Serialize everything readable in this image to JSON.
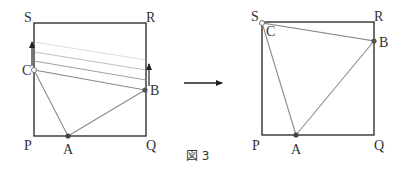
{
  "figure": {
    "caption": "図 3",
    "left_panel": {
      "labels": {
        "S": "S",
        "R": "R",
        "P": "P",
        "Q": "Q",
        "A": "A",
        "B": "B",
        "C": "C"
      },
      "square": {
        "x": 34,
        "y": 23,
        "size": 112
      },
      "points": {
        "A": [
          68,
          136
        ],
        "B": [
          145,
          90
        ],
        "C": [
          34,
          70
        ]
      },
      "motion_lines": [
        {
          "x1": 34,
          "y1": 42,
          "x2": 146,
          "y2": 60,
          "opacity": 0.3
        },
        {
          "x1": 34,
          "y1": 52,
          "x2": 146,
          "y2": 70,
          "opacity": 0.55
        },
        {
          "x1": 34,
          "y1": 61,
          "x2": 146,
          "y2": 80,
          "opacity": 0.8
        }
      ],
      "arrows": [
        "C moves up along PS",
        "B moves up along QR"
      ]
    },
    "transition_arrow": "→",
    "right_panel": {
      "labels": {
        "S": "S",
        "R": "R",
        "P": "P",
        "Q": "Q",
        "A": "A",
        "B": "B",
        "C": "C"
      },
      "square": {
        "x": 262,
        "y": 22,
        "size": 112
      },
      "points": {
        "A": [
          296,
          135
        ],
        "B": [
          374,
          41
        ],
        "C": [
          262,
          23
        ]
      }
    },
    "colors": {
      "square": "#222222",
      "triangle": "#8a8a8a",
      "point": "#555555",
      "text": "#333333"
    }
  }
}
